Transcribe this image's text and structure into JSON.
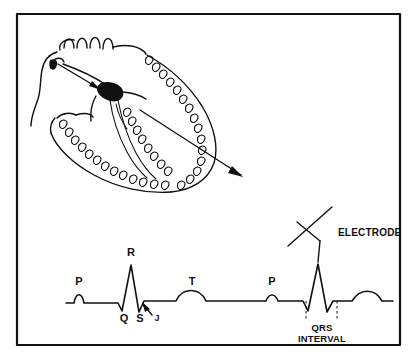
{
  "figure": {
    "frame_color": "#111111",
    "ink_color": "#111111",
    "background_color": "#ffffff"
  },
  "heart_diagram": {
    "name": "heart-cross-section",
    "description": "Line drawing of heart in cross-section showing conduction pathway",
    "sa_node": {
      "label": "",
      "shape": "filled-comma"
    },
    "av_node": {
      "label": "",
      "shape": "filled-blob"
    },
    "arrows": [
      {
        "name": "sa-to-av-arrow",
        "description": "arrow from sinoatrial node to atrioventricular node"
      },
      {
        "name": "depolarization-vector-arrow",
        "description": "long arrow from AV node toward ventricular apex"
      }
    ],
    "great_vessels_arch_count": 4
  },
  "ecg": {
    "name": "ecg-tracing",
    "baseline_y": 303,
    "labels": [
      {
        "id": "p1",
        "text": "P",
        "x": 79,
        "y": 285
      },
      {
        "id": "r1",
        "text": "R",
        "x": 131,
        "y": 256
      },
      {
        "id": "q1",
        "text": "Q",
        "x": 124,
        "y": 322
      },
      {
        "id": "s1",
        "text": "S",
        "x": 140,
        "y": 322
      },
      {
        "id": "j1",
        "text": "J",
        "x": 156,
        "y": 321
      },
      {
        "id": "t1",
        "text": "T",
        "x": 192,
        "y": 285
      },
      {
        "id": "p2",
        "text": "P",
        "x": 272,
        "y": 285
      }
    ],
    "annotations": [
      {
        "id": "electrode",
        "text": "ELECTRODE",
        "x": 338,
        "y": 233,
        "leader": "diagonal cross with line to R-wave peak"
      },
      {
        "id": "qrs-interval",
        "line1": "QRS",
        "line2": "INTERVAL",
        "x": 322,
        "y1": 325,
        "y2": 336,
        "marker_left_x": 306,
        "marker_right_x": 337
      }
    ],
    "waveform_points": "P-QRS-T-P-QRS-T repeating complex"
  }
}
